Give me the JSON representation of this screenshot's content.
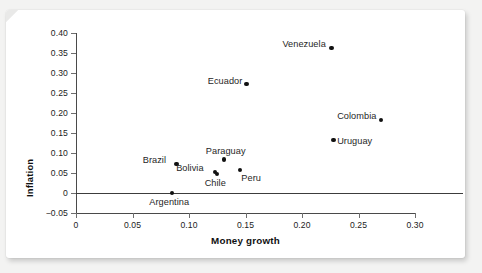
{
  "chart_data": {
    "type": "scatter",
    "title": "",
    "xlabel": "Money growth",
    "ylabel": "Inflation",
    "xlim": [
      0,
      0.3
    ],
    "ylim": [
      -0.05,
      0.4
    ],
    "xticks": [
      0,
      0.05,
      0.1,
      0.15,
      0.2,
      0.25,
      0.3
    ],
    "xtick_labels": [
      "0",
      "0.05",
      "0.10",
      "0.15",
      "0.20",
      "0.25",
      "0.30"
    ],
    "yticks": [
      -0.05,
      0,
      0.05,
      0.1,
      0.15,
      0.2,
      0.25,
      0.3,
      0.35,
      0.4
    ],
    "ytick_labels": [
      "-0.05",
      "0",
      "0.05",
      "0.10",
      "0.15",
      "0.20",
      "0.25",
      "0.30",
      "0.35",
      "0.40"
    ],
    "grid": false,
    "legend": false,
    "zero_line": true,
    "marker_color": "#111111",
    "points": [
      {
        "name": "Venezuela",
        "x": 0.226,
        "y": 0.363,
        "label_pos": "left"
      },
      {
        "name": "Ecuador",
        "x": 0.151,
        "y": 0.272,
        "label_pos": "left"
      },
      {
        "name": "Colombia",
        "x": 0.27,
        "y": 0.183,
        "label_pos": "left"
      },
      {
        "name": "Uruguay",
        "x": 0.228,
        "y": 0.133,
        "label_pos": "right"
      },
      {
        "name": "Paraguay",
        "x": 0.131,
        "y": 0.084,
        "label_pos": "above"
      },
      {
        "name": "Brazil",
        "x": 0.089,
        "y": 0.073,
        "label_pos": "left"
      },
      {
        "name": "Peru",
        "x": 0.145,
        "y": 0.058,
        "label_pos": "below-right"
      },
      {
        "name": "Bolivia",
        "x": 0.123,
        "y": 0.053,
        "label_pos": "left"
      },
      {
        "name": "Chile",
        "x": 0.125,
        "y": 0.047,
        "label_pos": "below"
      },
      {
        "name": "Argentina",
        "x": 0.085,
        "y": 0.0,
        "label_pos": "below"
      }
    ]
  }
}
